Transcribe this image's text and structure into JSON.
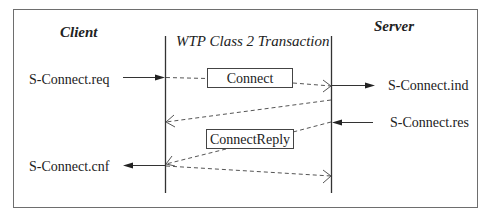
{
  "diagram": {
    "type": "sequence",
    "title": "WTP Class 2 Transaction",
    "participants": {
      "client": "Client",
      "server": "Server"
    },
    "primitives": {
      "connect_req": "S-Connect.req",
      "connect_ind": "S-Connect.ind",
      "connect_res": "S-Connect.res",
      "connect_cnf": "S-Connect.cnf"
    },
    "messages": [
      {
        "label": "Connect",
        "from": "client",
        "to": "server",
        "style": "dashed"
      },
      {
        "label": "",
        "from": "server",
        "to": "client",
        "style": "dashed",
        "note": "ack"
      },
      {
        "label": "ConnectReply",
        "from": "server",
        "to": "client",
        "style": "dashed"
      },
      {
        "label": "",
        "from": "client",
        "to": "server",
        "style": "dashed",
        "note": "ack"
      }
    ],
    "colors": {
      "line": "#333333",
      "dashed": "#555555",
      "frame": "#6e6e6e"
    }
  }
}
